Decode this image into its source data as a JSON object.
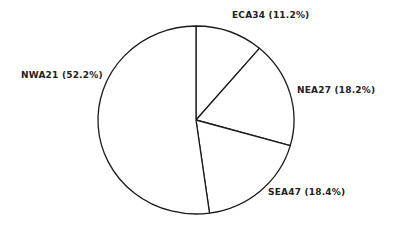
{
  "chart_data": {
    "type": "pie",
    "title": "",
    "start_angle_deg": 0,
    "direction": "clockwise",
    "slices": [
      {
        "name": "ECA34",
        "value": 11.2,
        "label": "ECA34 (11.2%)"
      },
      {
        "name": "NEA27",
        "value": 18.2,
        "label": "NEA27 (18.2%)"
      },
      {
        "name": "SEA47",
        "value": 18.4,
        "label": "SEA47 (18.4%)"
      },
      {
        "name": "NWA21",
        "value": 52.2,
        "label": "NWA21 (52.2%)"
      }
    ],
    "categories": [
      "ECA34",
      "NEA27",
      "SEA47",
      "NWA21"
    ],
    "values": [
      11.2,
      18.2,
      18.4,
      52.2
    ],
    "legend": "none",
    "fill": "#ffffff",
    "stroke": "#1a1a1a"
  },
  "labels": {
    "eca34": "ECA34 (11.2%)",
    "nea27": "NEA27 (18.2%)",
    "sea47": "SEA47 (18.4%)",
    "nwa21": "NWA21 (52.2%)"
  }
}
